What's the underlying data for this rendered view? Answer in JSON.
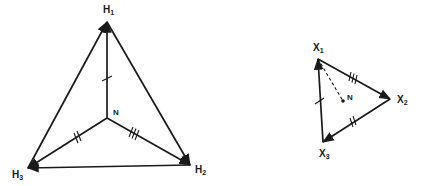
{
  "left_diagram": {
    "vertices": {
      "H1": {
        "label": "H",
        "sub": "1",
        "x": 107,
        "y": 22
      },
      "H2": {
        "label": "H",
        "sub": "2",
        "x": 190,
        "y": 165
      },
      "H3": {
        "label": "H",
        "sub": "3",
        "x": 28,
        "y": 168
      },
      "N": {
        "label": "N",
        "x": 107,
        "y": 118
      }
    },
    "outer_edges": [
      [
        "H1",
        "H2"
      ],
      [
        "H2",
        "H3"
      ],
      [
        "H3",
        "H1"
      ]
    ],
    "inner_edges": [
      {
        "from": "N",
        "to": "H1",
        "ticks": 1
      },
      {
        "from": "N",
        "to": "H3",
        "ticks": 2
      },
      {
        "from": "N",
        "to": "H2",
        "ticks": 3
      }
    ]
  },
  "right_diagram": {
    "vertices": {
      "X1": {
        "label": "X",
        "sub": "1",
        "x": 318,
        "y": 59
      },
      "X2": {
        "label": "X",
        "sub": "2",
        "x": 390,
        "y": 99
      },
      "X3": {
        "label": "X",
        "sub": "3",
        "x": 323,
        "y": 142
      },
      "N": {
        "label": "N",
        "x": 343,
        "y": 101
      }
    },
    "edges": [
      {
        "from": "X1",
        "to": "X2",
        "ticks": 3
      },
      {
        "from": "X2",
        "to": "X3",
        "ticks": 2
      },
      {
        "from": "X3",
        "to": "X1",
        "ticks": 1
      }
    ],
    "dashed_edge": {
      "from": "X1",
      "to": "N"
    }
  },
  "colors": {
    "ink": "#1a1a1a",
    "background": "#ffffff"
  }
}
